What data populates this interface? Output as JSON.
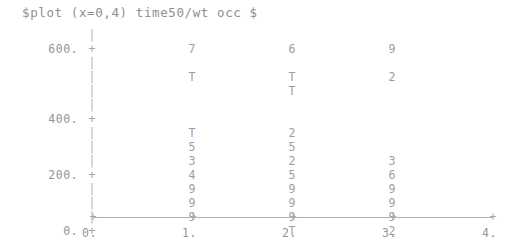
{
  "terminal": {
    "command_line": "$plot (x=0,4) time50/wt occ $"
  },
  "chart_data": {
    "type": "scatter",
    "title": "$plot (x=0,4) time50/wt occ $",
    "xlabel": "",
    "ylabel": "",
    "grid": false,
    "legend": null,
    "xlim": [
      0,
      4
    ],
    "ylim": [
      0,
      650
    ],
    "x_ticks": [
      "0.",
      "1.",
      "2.",
      "3.",
      "4."
    ],
    "x_tick_values": [
      0,
      1,
      2,
      3,
      4
    ],
    "y_ticks": [
      "600.",
      "400.",
      "200.",
      "0."
    ],
    "y_tick_values": [
      600,
      400,
      200,
      0
    ],
    "axis_tick_glyph": "+",
    "axis_bar_glyph": "|",
    "note": "Character-cell plot: each row is a y level, each glyph is a count code (digit = count, T = 10 or more).",
    "columns": [
      {
        "x": 1,
        "label": "1."
      },
      {
        "x": 2,
        "label": "2."
      },
      {
        "x": 3,
        "label": "3."
      }
    ],
    "rows": [
      {
        "ylabel": "",
        "axis": "|",
        "c1": "",
        "c2": "",
        "c3": ""
      },
      {
        "ylabel": "600.",
        "axis": "+",
        "c1": "7",
        "c2": "6",
        "c3": "9"
      },
      {
        "ylabel": "",
        "axis": "|",
        "c1": "",
        "c2": "",
        "c3": ""
      },
      {
        "ylabel": "",
        "axis": "|",
        "c1": "T",
        "c2": "T",
        "c3": "2"
      },
      {
        "ylabel": "",
        "axis": "|",
        "c1": "",
        "c2": "T",
        "c3": ""
      },
      {
        "ylabel": "",
        "axis": "|",
        "c1": "",
        "c2": "",
        "c3": ""
      },
      {
        "ylabel": "400.",
        "axis": "+",
        "c1": "",
        "c2": "",
        "c3": ""
      },
      {
        "ylabel": "",
        "axis": "|",
        "c1": "T",
        "c2": "2",
        "c3": ""
      },
      {
        "ylabel": "",
        "axis": "|",
        "c1": "5",
        "c2": "5",
        "c3": ""
      },
      {
        "ylabel": "",
        "axis": "|",
        "c1": "3",
        "c2": "2",
        "c3": "3"
      },
      {
        "ylabel": "200.",
        "axis": "+",
        "c1": "4",
        "c2": "5",
        "c3": "6"
      },
      {
        "ylabel": "",
        "axis": "|",
        "c1": "9",
        "c2": "9",
        "c3": "9"
      },
      {
        "ylabel": "",
        "axis": "|",
        "c1": "9",
        "c2": "9",
        "c3": "9"
      },
      {
        "ylabel": "",
        "axis": "|",
        "c1": "9",
        "c2": "9",
        "c3": "9"
      },
      {
        "ylabel": "0.",
        "axis": "+",
        "c1": "",
        "c2": "T",
        "c3": "2"
      }
    ],
    "series": [
      {
        "name": "x=1",
        "x": 1,
        "values": [
          "7",
          "T",
          "",
          "",
          "T",
          "5",
          "3",
          "4",
          "9",
          "9",
          "9",
          ""
        ]
      },
      {
        "name": "x=2",
        "x": 2,
        "values": [
          "6",
          "T",
          "T",
          "",
          "2",
          "5",
          "2",
          "5",
          "9",
          "9",
          "9",
          "T"
        ]
      },
      {
        "name": "x=3",
        "x": 3,
        "values": [
          "9",
          "2",
          "",
          "",
          "",
          "",
          "3",
          "6",
          "9",
          "9",
          "9",
          "2"
        ]
      }
    ]
  },
  "colors": {
    "background": "#ffffff",
    "text": "#9a9a9a",
    "axis": "#b0b0b0"
  }
}
